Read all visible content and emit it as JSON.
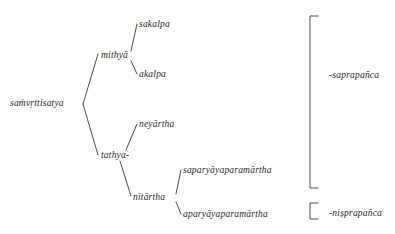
{
  "diagram": {
    "type": "tree",
    "title": "",
    "background_color": "#fdfdfc",
    "line_color": "#3a3a3a",
    "text_color": "#2b2b2b",
    "root": {
      "id": "samvrttisatya",
      "label": "saṁvṛttisatya",
      "x": 10,
      "y": 104
    },
    "nodes": [
      {
        "id": "mithya",
        "label": "mithyā",
        "x": 101,
        "y": 57,
        "level": 1
      },
      {
        "id": "sakalpa",
        "label": "sakalpa",
        "x": 139,
        "y": 26,
        "level": 2
      },
      {
        "id": "akalpa",
        "label": "akalpa",
        "x": 139,
        "y": 76,
        "level": 2
      },
      {
        "id": "tathya",
        "label": "tathya-",
        "x": 101,
        "y": 157,
        "level": 1
      },
      {
        "id": "neyartha",
        "label": "neyārtha",
        "x": 139,
        "y": 126,
        "level": 2
      },
      {
        "id": "nitartha",
        "label": "nītārtha",
        "x": 133,
        "y": 199,
        "level": 2
      },
      {
        "id": "saparyayaparamartha",
        "label": "saparyāyaparamārtha",
        "x": 183,
        "y": 172,
        "level": 3
      },
      {
        "id": "aparyayaparamartha",
        "label": "aparyāyaparamārtha",
        "x": 183,
        "y": 216,
        "level": 3
      }
    ],
    "edges": [
      {
        "from": "samvrttisatya",
        "to": "mithya"
      },
      {
        "from": "samvrttisatya",
        "to": "tathya"
      },
      {
        "from": "mithya",
        "to": "sakalpa"
      },
      {
        "from": "mithya",
        "to": "akalpa"
      },
      {
        "from": "tathya",
        "to": "neyartha"
      },
      {
        "from": "tathya",
        "to": "nitartha"
      },
      {
        "from": "nitartha",
        "to": "saparyayaparamartha"
      },
      {
        "from": "nitartha",
        "to": "aparyayaparamartha"
      }
    ],
    "brackets": [
      {
        "id": "saprapanca-bracket",
        "label": "-saprapañca",
        "top": 16,
        "bottom": 188,
        "x": 310,
        "label_x": 329,
        "label_y": 76
      },
      {
        "id": "nisprapanca-bracket",
        "label": "-niṣprapañca",
        "top": 203,
        "bottom": 219,
        "x": 310,
        "label_x": 329,
        "label_y": 214
      }
    ]
  }
}
